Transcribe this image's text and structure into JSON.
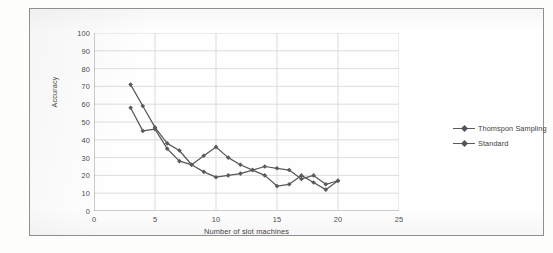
{
  "figure": {
    "background_color": "#fdfdfc",
    "frame_border_color": "#8f8f8f",
    "caption_partial": ""
  },
  "chart_data": {
    "type": "line",
    "title": "",
    "xlabel": "Number of slot machines",
    "ylabel": "Accuracy",
    "xlim": [
      0,
      25
    ],
    "ylim": [
      0,
      100
    ],
    "xticks": [
      0,
      5,
      10,
      15,
      20,
      25
    ],
    "yticks": [
      0,
      10,
      20,
      30,
      40,
      50,
      60,
      70,
      80,
      90,
      100
    ],
    "grid": true,
    "grid_color": "#d4d4d4",
    "legend_position": "right",
    "series_color": "#595959",
    "marker": "diamond",
    "x": [
      3,
      4,
      5,
      6,
      7,
      8,
      9,
      10,
      11,
      12,
      13,
      14,
      15,
      16,
      17,
      18,
      19,
      20
    ],
    "series": [
      {
        "name": "Thomspon Sampling",
        "color": "#595959",
        "values": [
          71,
          59,
          47,
          38,
          34,
          26,
          31,
          36,
          30,
          26,
          23,
          25,
          24,
          23,
          18,
          20,
          15,
          17
        ]
      },
      {
        "name": "Standard",
        "color": "#595959",
        "values": [
          58,
          45,
          46,
          35,
          28,
          26,
          22,
          19,
          20,
          21,
          23,
          20,
          14,
          15,
          20,
          16,
          12,
          17
        ]
      }
    ]
  },
  "legend": {
    "entries": [
      {
        "label": "Thomspon Sampling"
      },
      {
        "label": "Standard"
      }
    ]
  }
}
